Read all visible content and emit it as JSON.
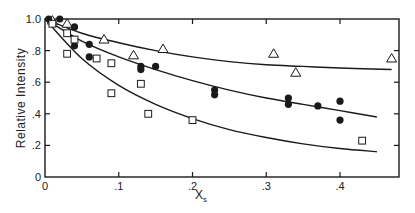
{
  "chart_data": {
    "type": "scatter",
    "title": "",
    "xlabel": "X",
    "xlabel_subscript": "s",
    "ylabel": "Relative  Intensity",
    "xlim": [
      0,
      0.48
    ],
    "ylim": [
      0,
      1.0
    ],
    "grid": false,
    "legend": null,
    "x_ticks": [
      {
        "value": 0,
        "label": "0"
      },
      {
        "value": 0.1,
        "label": ".1"
      },
      {
        "value": 0.2,
        "label": ".2"
      },
      {
        "value": 0.3,
        "label": ".3"
      },
      {
        "value": 0.4,
        "label": ".4"
      }
    ],
    "y_ticks": [
      {
        "value": 0,
        "label": "0"
      },
      {
        "value": 0.2,
        "label": ".2"
      },
      {
        "value": 0.4,
        "label": ".4"
      },
      {
        "value": 0.6,
        "label": ".6"
      },
      {
        "value": 0.8,
        "label": ".8"
      },
      {
        "value": 1.0,
        "label": "1.0"
      }
    ],
    "series": [
      {
        "name": "open triangles",
        "marker": "triangle-open",
        "points": [
          [
            0.01,
            0.99
          ],
          [
            0.03,
            0.97
          ],
          [
            0.08,
            0.87
          ],
          [
            0.12,
            0.77
          ],
          [
            0.16,
            0.81
          ],
          [
            0.31,
            0.78
          ],
          [
            0.34,
            0.66
          ],
          [
            0.47,
            0.75
          ]
        ]
      },
      {
        "name": "filled circles",
        "marker": "circle-filled",
        "points": [
          [
            0.005,
            1.0
          ],
          [
            0.02,
            1.0
          ],
          [
            0.04,
            0.95
          ],
          [
            0.04,
            0.83
          ],
          [
            0.06,
            0.84
          ],
          [
            0.06,
            0.76
          ],
          [
            0.13,
            0.7
          ],
          [
            0.13,
            0.68
          ],
          [
            0.15,
            0.7
          ],
          [
            0.23,
            0.55
          ],
          [
            0.23,
            0.52
          ],
          [
            0.33,
            0.5
          ],
          [
            0.33,
            0.46
          ],
          [
            0.37,
            0.45
          ],
          [
            0.4,
            0.48
          ],
          [
            0.4,
            0.36
          ]
        ]
      },
      {
        "name": "open squares",
        "marker": "square-open",
        "points": [
          [
            0.01,
            0.97
          ],
          [
            0.03,
            0.91
          ],
          [
            0.04,
            0.87
          ],
          [
            0.03,
            0.78
          ],
          [
            0.07,
            0.75
          ],
          [
            0.09,
            0.53
          ],
          [
            0.09,
            0.72
          ],
          [
            0.13,
            0.59
          ],
          [
            0.14,
            0.4
          ],
          [
            0.2,
            0.36
          ],
          [
            0.43,
            0.23
          ]
        ]
      }
    ],
    "fit_curves": [
      {
        "name": "upper fit (triangles)",
        "x": [
          0,
          0.05,
          0.1,
          0.15,
          0.2,
          0.25,
          0.3,
          0.35,
          0.4,
          0.47
        ],
        "y": [
          1.0,
          0.91,
          0.85,
          0.8,
          0.76,
          0.73,
          0.71,
          0.7,
          0.69,
          0.68
        ]
      },
      {
        "name": "middle fit (circles)",
        "x": [
          0,
          0.05,
          0.1,
          0.15,
          0.2,
          0.25,
          0.3,
          0.35,
          0.4,
          0.45
        ],
        "y": [
          1.0,
          0.86,
          0.76,
          0.68,
          0.61,
          0.55,
          0.5,
          0.46,
          0.42,
          0.38
        ]
      },
      {
        "name": "lower fit (squares)",
        "x": [
          0,
          0.05,
          0.1,
          0.15,
          0.2,
          0.25,
          0.3,
          0.35,
          0.4,
          0.45
        ],
        "y": [
          1.0,
          0.75,
          0.58,
          0.46,
          0.37,
          0.3,
          0.25,
          0.21,
          0.18,
          0.16
        ]
      }
    ]
  },
  "colors": {
    "ink": "#1a1a1a",
    "background": "#ffffff"
  }
}
